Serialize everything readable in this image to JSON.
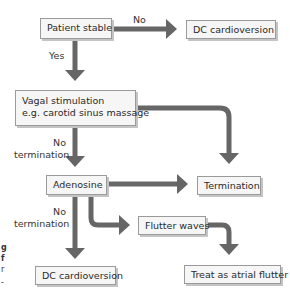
{
  "diagram": {
    "type": "flowchart",
    "colors": {
      "arrow": "#666666",
      "box_fill": "#f6f6f6",
      "box_border": "#9a9a9a",
      "box_shadow": "#c4c4c4"
    },
    "nodes": [
      {
        "id": "patient_stable",
        "label": "Patient stable"
      },
      {
        "id": "dc_cardioversion_1",
        "label": "DC cardioversion"
      },
      {
        "id": "vagal_stimulation",
        "line1": "Vagal stimulation",
        "line2": "e.g. carotid sinus massage"
      },
      {
        "id": "adenosine",
        "label": "Adenosine"
      },
      {
        "id": "termination",
        "label": "Termination"
      },
      {
        "id": "flutter_waves",
        "label": "Flutter waves"
      },
      {
        "id": "dc_cardioversion_2",
        "label": "DC cardioversion"
      },
      {
        "id": "treat_atrial_flutter",
        "label": "Treat as atrial flutter"
      }
    ],
    "edge_labels": {
      "no_top": "No",
      "yes": "Yes",
      "no_termination_1_line1": "No",
      "no_termination_1_line2": "termination",
      "no_termination_2_line1": "No",
      "no_termination_2_line2": "termination"
    },
    "edges": [
      {
        "from": "patient_stable",
        "to": "dc_cardioversion_1",
        "label": "No"
      },
      {
        "from": "patient_stable",
        "to": "vagal_stimulation",
        "label": "Yes"
      },
      {
        "from": "vagal_stimulation",
        "to": "termination",
        "label": ""
      },
      {
        "from": "vagal_stimulation",
        "to": "adenosine",
        "label": "No termination"
      },
      {
        "from": "adenosine",
        "to": "termination",
        "label": ""
      },
      {
        "from": "adenosine",
        "to": "dc_cardioversion_2",
        "label": "No termination"
      },
      {
        "from": "adenosine",
        "to": "flutter_waves",
        "label": ""
      },
      {
        "from": "flutter_waves",
        "to": "treat_atrial_flutter",
        "label": ""
      }
    ],
    "left_margin_fragments": [
      "g",
      "f",
      "r",
      "-"
    ]
  }
}
